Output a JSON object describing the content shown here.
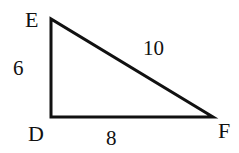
{
  "diagram": {
    "type": "right-triangle",
    "stroke_color": "#111111",
    "background": "#ffffff",
    "vertices": [
      {
        "name": "E",
        "label": "E",
        "x": 51,
        "y": 19
      },
      {
        "name": "D",
        "label": "D",
        "x": 51,
        "y": 117
      },
      {
        "name": "F",
        "label": "F",
        "x": 213,
        "y": 117
      }
    ],
    "sides": [
      {
        "between": "E-D",
        "length_label": "6"
      },
      {
        "between": "D-F",
        "length_label": "8"
      },
      {
        "between": "E-F",
        "length_label": "10"
      }
    ],
    "right_angle_at": "D"
  }
}
